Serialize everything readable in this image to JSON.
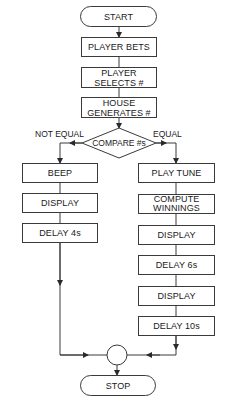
{
  "diagram": {
    "type": "flowchart",
    "colors": {
      "line": "#3a3a3a",
      "text": "#1a1a1a",
      "background": "#ffffff"
    },
    "start": {
      "label": "START"
    },
    "main_sequence": [
      {
        "id": "player-bets",
        "label": "PLAYER BETS"
      },
      {
        "id": "player-selects",
        "label": "PLAYER SELECTS #"
      },
      {
        "id": "house-generates",
        "label": "HOUSE GENERATES #"
      }
    ],
    "decision": {
      "label": "COMPARE #s",
      "left_branch_label": "NOT EQUAL",
      "right_branch_label": "EQUAL"
    },
    "not_equal_branch": [
      {
        "id": "beep",
        "label": "BEEP"
      },
      {
        "id": "display-left",
        "label": "DISPLAY"
      },
      {
        "id": "delay-4s",
        "label": "DELAY 4s"
      }
    ],
    "equal_branch": [
      {
        "id": "play-tune",
        "label": "PLAY TUNE"
      },
      {
        "id": "compute-winnings",
        "label": "COMPUTE WINNINGS"
      },
      {
        "id": "display-right-1",
        "label": "DISPLAY"
      },
      {
        "id": "delay-6s",
        "label": "DELAY 6s"
      },
      {
        "id": "display-right-2",
        "label": "DISPLAY"
      },
      {
        "id": "delay-10s",
        "label": "DELAY 10s"
      }
    ],
    "stop": {
      "label": "STOP"
    }
  }
}
